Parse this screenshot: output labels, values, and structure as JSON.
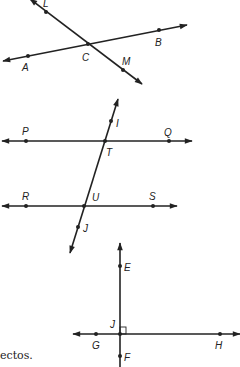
{
  "figures": [
    {
      "name": "intersecting-lines",
      "lines": [
        {
          "name": "line-AB",
          "points": [
            "A",
            "C",
            "B"
          ]
        },
        {
          "name": "line-LM",
          "points": [
            "L",
            "C",
            "M"
          ]
        }
      ],
      "labels": {
        "L": "L",
        "A": "A",
        "C": "C",
        "B": "B",
        "M": "M"
      }
    },
    {
      "name": "parallel-lines-with-transversal",
      "lines": [
        {
          "name": "line-PQ",
          "points": [
            "P",
            "T",
            "Q"
          ]
        },
        {
          "name": "line-RS",
          "points": [
            "R",
            "U",
            "S"
          ]
        },
        {
          "name": "transversal-IJ",
          "points": [
            "I",
            "T",
            "U",
            "J"
          ]
        }
      ],
      "labels": {
        "P": "P",
        "Q": "Q",
        "I": "I",
        "T": "T",
        "R": "R",
        "U": "U",
        "S": "S",
        "J": "J"
      }
    },
    {
      "name": "perpendicular-lines",
      "lines": [
        {
          "name": "line-GH",
          "points": [
            "G",
            "J",
            "H"
          ]
        },
        {
          "name": "line-EF",
          "points": [
            "E",
            "J",
            "F"
          ]
        }
      ],
      "right_angle_at": "J",
      "labels": {
        "E": "E",
        "J": "J",
        "G": "G",
        "H": "H",
        "F": "F"
      }
    }
  ],
  "caption": "ectos."
}
